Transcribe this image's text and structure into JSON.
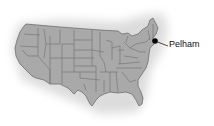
{
  "map": {
    "region": "Contiguous United States",
    "style": "grayscale state-boundary map with soft shadow",
    "colors": {
      "land": "#a9a9a9",
      "border": "#6e6e6e",
      "shadow": "#e2e2e2",
      "marker": "#000000",
      "label": "#111111"
    },
    "markers": [
      {
        "name": "Pelham",
        "x": 155,
        "y": 41
      }
    ]
  }
}
